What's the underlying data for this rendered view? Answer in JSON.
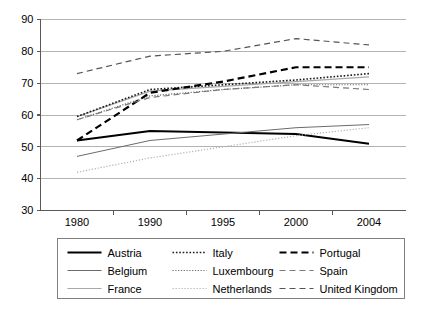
{
  "chart_data": {
    "type": "line",
    "title": "",
    "subtitle": "",
    "xlabel": "",
    "ylabel": "",
    "categories": [
      "1980",
      "1990",
      "1995",
      "2000",
      "2004"
    ],
    "ylim": [
      30,
      90
    ],
    "yticks": [
      30,
      40,
      50,
      60,
      70,
      80,
      90
    ],
    "ytick_labels": [
      "30",
      "40",
      "50",
      "60",
      "70",
      "80",
      "90"
    ],
    "grid": true,
    "grid_axis": "y",
    "legend_position": "bottom",
    "legend_columns": 3,
    "series": [
      {
        "name": "Austria",
        "values": [
          52,
          55,
          54.5,
          54,
          51
        ],
        "style": "solid",
        "color": "#000000",
        "width": 2.0,
        "dash": "none"
      },
      {
        "name": "Belgium",
        "values": [
          47,
          52,
          54,
          56,
          57
        ],
        "style": "solid",
        "color": "#6b6b6b",
        "width": 1.0,
        "dash": "none"
      },
      {
        "name": "France",
        "values": [
          59.5,
          67.5,
          69,
          70.5,
          72
        ],
        "style": "solid",
        "color": "#a8a8a8",
        "width": 1.2,
        "dash": "none"
      },
      {
        "name": "Italy",
        "values": [
          59.5,
          68,
          69.5,
          71,
          73
        ],
        "style": "dotted",
        "color": "#1a1a1a",
        "width": 1.6,
        "dash": "1.6 1.8"
      },
      {
        "name": "Luxembourg",
        "values": [
          58.5,
          66,
          68,
          69.5,
          69.5
        ],
        "style": "dotted",
        "color": "#6b6b6b",
        "width": 1.2,
        "dash": "1.2 1.6"
      },
      {
        "name": "Netherlands",
        "values": [
          42,
          46.5,
          50,
          53.5,
          56
        ],
        "style": "dotted",
        "color": "#b0b0b0",
        "width": 1.2,
        "dash": "1.2 1.8"
      },
      {
        "name": "Portugal",
        "values": [
          52,
          67,
          70.5,
          75,
          75
        ],
        "style": "dashed",
        "color": "#000000",
        "width": 2.2,
        "dash": "7 4"
      },
      {
        "name": "Spain",
        "values": [
          58.5,
          65.5,
          68,
          69.5,
          68
        ],
        "style": "dashed",
        "color": "#7a7a7a",
        "width": 1.2,
        "dash": "6 4"
      },
      {
        "name": "United Kingdom",
        "values": [
          73,
          78.5,
          80,
          84,
          82
        ],
        "style": "dashed",
        "color": "#555555",
        "width": 1.2,
        "dash": "6 4"
      }
    ]
  },
  "axes": {
    "y_tick_labels": [
      "90",
      "80",
      "70",
      "60",
      "50",
      "40",
      "30"
    ],
    "x_tick_labels": [
      "1980",
      "1990",
      "1995",
      "2000",
      "2004"
    ]
  },
  "legend": {
    "entries": [
      {
        "label": "Austria"
      },
      {
        "label": "Italy"
      },
      {
        "label": "Portugal"
      },
      {
        "label": "Belgium"
      },
      {
        "label": "Luxembourg"
      },
      {
        "label": "Spain"
      },
      {
        "label": "France"
      },
      {
        "label": "Netherlands"
      },
      {
        "label": "United Kingdom"
      }
    ]
  },
  "style": {
    "background": "#ffffff",
    "axis_color": "#595959",
    "grid_color": "#b3b3b3",
    "legend_border": "#808080",
    "text_color": "#000000"
  }
}
